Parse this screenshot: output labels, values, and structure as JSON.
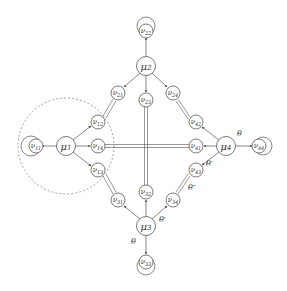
{
  "diagram": {
    "type": "graph",
    "clusters": [
      {
        "id": "mu1",
        "label": "μ1",
        "x": 66,
        "y": 146,
        "satellites": [
          {
            "id": "nu11",
            "label": "ν11",
            "x": 34,
            "y": 146,
            "self_loop": true
          },
          {
            "id": "nu12",
            "label": "ν12",
            "x": 98,
            "y": 122
          },
          {
            "id": "nu14",
            "label": "ν14",
            "x": 98,
            "y": 146
          },
          {
            "id": "nu13",
            "label": "ν13",
            "x": 98,
            "y": 170
          }
        ]
      },
      {
        "id": "mu2",
        "label": "μ2",
        "x": 146,
        "y": 66,
        "satellites": [
          {
            "id": "nu22",
            "label": "ν22",
            "x": 146,
            "y": 30,
            "self_loop": true
          },
          {
            "id": "nu21",
            "label": "ν21",
            "x": 118,
            "y": 93
          },
          {
            "id": "nu23",
            "label": "ν23",
            "x": 146,
            "y": 100
          },
          {
            "id": "nu24",
            "label": "ν24",
            "x": 173,
            "y": 93
          }
        ]
      },
      {
        "id": "mu3",
        "label": "μ3",
        "x": 146,
        "y": 226,
        "satellites": [
          {
            "id": "nu31",
            "label": "ν31",
            "x": 118,
            "y": 200
          },
          {
            "id": "nu32",
            "label": "ν32",
            "x": 146,
            "y": 192
          },
          {
            "id": "nu34",
            "label": "ν34",
            "x": 173,
            "y": 200
          },
          {
            "id": "nu33",
            "label": "ν33",
            "x": 146,
            "y": 262,
            "self_loop": true
          }
        ]
      },
      {
        "id": "mu4",
        "label": "μ4",
        "x": 226,
        "y": 146,
        "satellites": [
          {
            "id": "nu42",
            "label": "ν42",
            "x": 196,
            "y": 122
          },
          {
            "id": "nu41",
            "label": "ν41",
            "x": 196,
            "y": 146
          },
          {
            "id": "nu43",
            "label": "ν43",
            "x": 196,
            "y": 170
          },
          {
            "id": "nu44",
            "label": "ν44",
            "x": 260,
            "y": 146,
            "self_loop": true
          }
        ]
      }
    ],
    "links": [
      {
        "from": "nu21",
        "to": "nu12"
      },
      {
        "from": "nu24",
        "to": "nu42"
      },
      {
        "from": "nu14",
        "to": "nu41"
      },
      {
        "from": "nu23",
        "to": "nu32"
      },
      {
        "from": "nu13",
        "to": "nu31"
      },
      {
        "from": "nu43",
        "to": "nu34"
      }
    ],
    "annotations": {
      "theta_mu4": "θ",
      "theta_prime_mu4": "θ′",
      "theta_double_prime": "θ″",
      "theta_mu3": "θ",
      "theta_prime_mu3": "θ′"
    },
    "dashed_region": {
      "cx": 66,
      "cy": 146,
      "r": 48
    }
  },
  "labels": {
    "mu1": {
      "base": "μ",
      "sub": "1"
    },
    "mu2": {
      "base": "μ",
      "sub": "2"
    },
    "mu3": {
      "base": "μ",
      "sub": "3"
    },
    "mu4": {
      "base": "μ",
      "sub": "4"
    },
    "nu11": {
      "base": "ν",
      "sub": "11"
    },
    "nu12": {
      "base": "ν",
      "sub": "12"
    },
    "nu13": {
      "base": "ν",
      "sub": "13"
    },
    "nu14": {
      "base": "ν",
      "sub": "14"
    },
    "nu21": {
      "base": "ν",
      "sub": "21"
    },
    "nu22": {
      "base": "ν",
      "sub": "22"
    },
    "nu23": {
      "base": "ν",
      "sub": "23"
    },
    "nu24": {
      "base": "ν",
      "sub": "24"
    },
    "nu31": {
      "base": "ν",
      "sub": "31"
    },
    "nu32": {
      "base": "ν",
      "sub": "32"
    },
    "nu33": {
      "base": "ν",
      "sub": "33"
    },
    "nu34": {
      "base": "ν",
      "sub": "34"
    },
    "nu41": {
      "base": "ν",
      "sub": "41"
    },
    "nu42": {
      "base": "ν",
      "sub": "42"
    },
    "nu43": {
      "base": "ν",
      "sub": "43"
    },
    "nu44": {
      "base": "ν",
      "sub": "44"
    }
  }
}
